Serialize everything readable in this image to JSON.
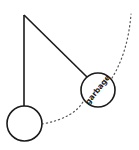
{
  "diagram": {
    "type": "pendulum",
    "colors": {
      "stroke": "#1a1a1a",
      "dotted": "#555555",
      "background": "#ffffff"
    },
    "pivot": {
      "x": 24,
      "y": 15
    },
    "bobs": [
      {
        "id": "rest-bob",
        "cx": 24.5,
        "cy": 123.5,
        "r": 17.5,
        "label": ""
      },
      {
        "id": "swung-bob",
        "cx": 98,
        "cy": 90,
        "r": 17,
        "label": "garbage"
      }
    ],
    "swing_path": "dotted arc"
  }
}
